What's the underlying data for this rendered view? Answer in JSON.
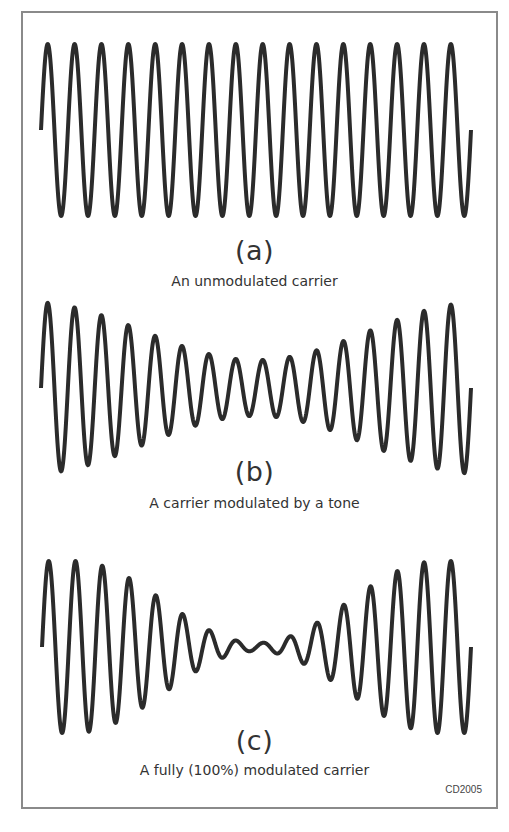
{
  "figure": {
    "code": "CD2005",
    "panels": [
      {
        "id": "a",
        "letter": "(a)",
        "caption": "An unmodulated carrier"
      },
      {
        "id": "b",
        "letter": "(b)",
        "caption": "A carrier modulated by a tone"
      },
      {
        "id": "c",
        "letter": "(c)",
        "caption": "A fully (100%) modulated carrier"
      }
    ]
  },
  "colors": {
    "stroke": "#2b2b2b",
    "text": "#333333",
    "frame": "#8a8a8a",
    "background": "#ffffff"
  },
  "chart_data": [
    {
      "type": "line",
      "title": "(a) An unmodulated carrier",
      "carrier_cycles": 16,
      "modulation_depth_percent": 0,
      "x_range_px": [
        41,
        471
      ],
      "center_y_px": 130,
      "amplitude_max_px": 86,
      "amplitude_min_px": 86,
      "envelope_width": 1.0
    },
    {
      "type": "line",
      "title": "(b) A carrier modulated by a tone",
      "carrier_cycles": 16,
      "modulation_depth_percent": 50,
      "x_range_px": [
        41,
        471
      ],
      "center_y_px": 388,
      "amplitude_max_px": 86,
      "amplitude_min_px": 28,
      "envelope_width": 1.05
    },
    {
      "type": "line",
      "title": "(c) A fully (100%) modulated carrier",
      "carrier_cycles": 16,
      "modulation_depth_percent": 100,
      "x_range_px": [
        42,
        471
      ],
      "center_y_px": 647,
      "amplitude_max_px": 86,
      "amplitude_min_px": 4,
      "envelope_width": 0.85
    }
  ]
}
